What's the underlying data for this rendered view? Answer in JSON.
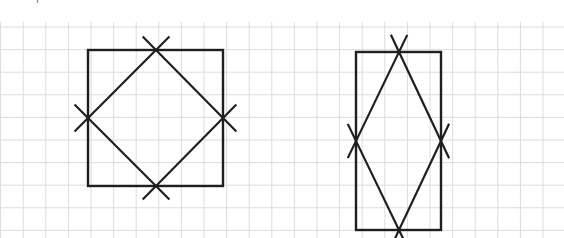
{
  "page": {
    "width": 564,
    "height": 238,
    "background_color": "#ffffff",
    "top_cropped_glyph": "|"
  },
  "grid": {
    "name": "graph-paper-grid",
    "cell_size_px": 22.6,
    "line_color": "#dcdcdc",
    "line_width_px": 1,
    "origin_x_px": 0.6,
    "origin_y_px": 4.4,
    "columns": 25,
    "rows": 11,
    "top_edge_y_px": 27,
    "bottom_edge_y_px": 231
  },
  "figures": [
    {
      "id": "left-figure",
      "name": "square-with-inscribed-diamond",
      "outer_shape": "square",
      "outer": {
        "x": 88,
        "y": 50,
        "width": 135,
        "height": 136
      },
      "outer_color": "#1f1f1f",
      "inner_shape": "diamond",
      "inner_vertices": [
        {
          "label": "top",
          "x": 156,
          "y": 50
        },
        {
          "label": "right",
          "x": 223,
          "y": 118
        },
        {
          "label": "bottom",
          "x": 156,
          "y": 186
        },
        {
          "label": "left",
          "x": 88,
          "y": 118
        }
      ],
      "overshoot_px": 19,
      "cross_marks": 4,
      "description": "Square outline with an inscribed rotated square (diamond) whose vertices sit on the midpoints of the square's sides; each diamond edge is extended past the vertex so the midpoints read as X crosses."
    },
    {
      "id": "right-figure",
      "name": "rectangle-with-inscribed-rhombus",
      "outer_shape": "rectangle",
      "outer": {
        "x": 356,
        "y": 52,
        "width": 85,
        "height": 178
      },
      "outer_color": "#1f1f1f",
      "inner_shape": "rhombus",
      "inner_vertices": [
        {
          "label": "top",
          "x": 399,
          "y": 52
        },
        {
          "label": "right",
          "x": 441,
          "y": 141
        },
        {
          "label": "bottom",
          "x": 399,
          "y": 230
        },
        {
          "label": "left",
          "x": 356,
          "y": 141
        }
      ],
      "overshoot_px": 19,
      "cross_marks": 4,
      "description": "Tall rectangle outline with an inscribed rhombus whose vertices sit on the midpoints of the rectangle's sides; each rhombus edge is extended past the vertex forming X crosses."
    }
  ]
}
